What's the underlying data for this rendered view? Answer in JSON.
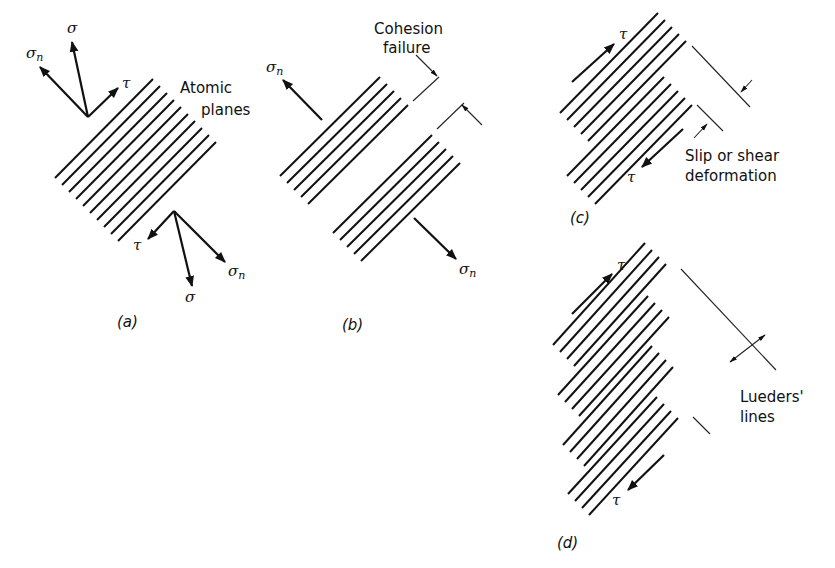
{
  "figure": {
    "panels": [
      {
        "id": "a",
        "caption": "(a)",
        "labels": {
          "planes": [
            "Atomic",
            "planes"
          ],
          "sigma": "σ",
          "sigma_n": "σ",
          "sigma_n_sub": "n",
          "tau": "τ"
        }
      },
      {
        "id": "b",
        "caption": "(b)",
        "labels": {
          "failure": [
            "Cohesion",
            "failure"
          ],
          "sigma_n": "σ",
          "sigma_n_sub": "n"
        }
      },
      {
        "id": "c",
        "caption": "(c)",
        "labels": {
          "slip": [
            "Slip or shear",
            "deformation"
          ],
          "tau": "τ"
        }
      },
      {
        "id": "d",
        "caption": "(d)",
        "labels": {
          "lueders": [
            "Lueders'",
            "lines"
          ],
          "tau": "τ"
        }
      }
    ],
    "colors": {
      "ink": "#111111",
      "background": "#ffffff"
    }
  }
}
